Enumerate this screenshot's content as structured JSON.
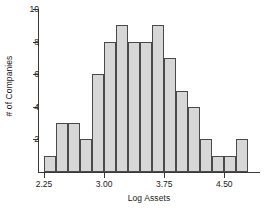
{
  "chart_data": {
    "type": "bar",
    "subtype": "histogram",
    "title": "",
    "xlabel": "Log Assets",
    "ylabel": "# of Companies",
    "xlim": [
      2.175,
      4.945
    ],
    "ylim": [
      0,
      10
    ],
    "grid": false,
    "legend": null,
    "bin_width": 0.15,
    "bin_starts": [
      2.25,
      2.4,
      2.55,
      2.7,
      2.85,
      3.0,
      3.15,
      3.3,
      3.45,
      3.6,
      3.75,
      3.9,
      4.05,
      4.2,
      4.35,
      4.5,
      4.65
    ],
    "bin_ends": [
      2.4,
      2.55,
      2.7,
      2.85,
      3.0,
      3.15,
      3.3,
      3.45,
      3.6,
      3.75,
      3.9,
      4.05,
      4.2,
      4.35,
      4.5,
      4.65,
      4.8
    ],
    "categories": [
      "2.25-2.40",
      "2.40-2.55",
      "2.55-2.70",
      "2.70-2.85",
      "2.85-3.00",
      "3.00-3.15",
      "3.15-3.30",
      "3.30-3.45",
      "3.45-3.60",
      "3.60-3.75",
      "3.75-3.90",
      "3.90-4.05",
      "4.05-4.20",
      "4.20-4.35",
      "4.35-4.50",
      "4.50-4.65",
      "4.65-4.80"
    ],
    "values": [
      1,
      3,
      3,
      2,
      6,
      8,
      9,
      8,
      8,
      9,
      7,
      5,
      4,
      2,
      1,
      1,
      2
    ],
    "total_count": 79,
    "xticks": [
      2.25,
      3.0,
      3.75,
      4.5
    ],
    "xticklabels": [
      "2.25",
      "3.00",
      "3.75",
      "4.50"
    ],
    "yticks": [
      2,
      4,
      6,
      8,
      10
    ],
    "yticklabels": [
      "2",
      "4",
      "6",
      "8",
      "10"
    ],
    "bar_fill_color": "#d7d7d7",
    "bar_edge_color": "#4a4a4a",
    "axis_color": "#3a3a3a",
    "background_color": "#ffffff"
  }
}
